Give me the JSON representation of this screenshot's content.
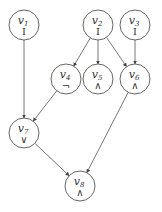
{
  "diagram": {
    "type": "directed-acyclic-graph",
    "nodes": [
      {
        "id": "v1",
        "name": "v",
        "sub": "1",
        "op": "I",
        "x": 24,
        "y": 25
      },
      {
        "id": "v2",
        "name": "v",
        "sub": "2",
        "op": "I",
        "x": 98,
        "y": 25
      },
      {
        "id": "v3",
        "name": "v",
        "sub": "3",
        "op": "I",
        "x": 135,
        "y": 25
      },
      {
        "id": "v4",
        "name": "v",
        "sub": "4",
        "op": "¬",
        "x": 66,
        "y": 79
      },
      {
        "id": "v5",
        "name": "v",
        "sub": "5",
        "op": "∧",
        "x": 98,
        "y": 79
      },
      {
        "id": "v6",
        "name": "v",
        "sub": "6",
        "op": "∧",
        "x": 135,
        "y": 79
      },
      {
        "id": "v7",
        "name": "v",
        "sub": "7",
        "op": "∨",
        "x": 24,
        "y": 133
      },
      {
        "id": "v8",
        "name": "v",
        "sub": "8",
        "op": "∧",
        "x": 80,
        "y": 186
      }
    ],
    "edges": [
      {
        "from": "v1",
        "to": "v7"
      },
      {
        "from": "v2",
        "to": "v4"
      },
      {
        "from": "v2",
        "to": "v5"
      },
      {
        "from": "v2",
        "to": "v6"
      },
      {
        "from": "v3",
        "to": "v6"
      },
      {
        "from": "v4",
        "to": "v7"
      },
      {
        "from": "v7",
        "to": "v8"
      },
      {
        "from": "v6",
        "to": "v8"
      }
    ],
    "node_radius": 15,
    "colors": {
      "stroke": "#555555",
      "text": "#333333",
      "background": "#ffffff"
    }
  }
}
